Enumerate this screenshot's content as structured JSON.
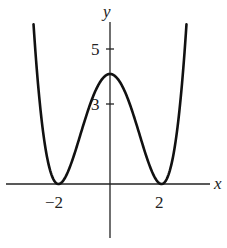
{
  "chart_data": {
    "type": "line",
    "title": "",
    "xlabel": "x",
    "ylabel": "y",
    "function_description": "quartic with double roots at x=-2 and x=2, local maximum at (0,4)",
    "x_ticks": [
      {
        "value": -2,
        "label": "−2"
      },
      {
        "value": 2,
        "label": "2"
      }
    ],
    "y_ticks": [
      {
        "value": 3,
        "label": "3"
      },
      {
        "value": 5,
        "label": "5"
      }
    ],
    "xlim": [
      -4.25,
      4.25
    ],
    "ylim": [
      -2,
      6.3
    ],
    "grid": false,
    "legend": null,
    "series": [
      {
        "name": "f(x)",
        "x": [
          -2.97,
          -2.5,
          -2.0,
          -1.5,
          -1.0,
          -0.5,
          0.0,
          0.5,
          1.0,
          1.5,
          2.0,
          2.5,
          2.97
        ],
        "y": [
          5.85,
          1.27,
          0.0,
          0.77,
          2.25,
          3.52,
          4.0,
          3.52,
          2.25,
          0.77,
          0.0,
          1.27,
          5.85
        ]
      }
    ],
    "key_points": [
      {
        "x": -2,
        "y": 0,
        "kind": "minimum"
      },
      {
        "x": 0,
        "y": 4,
        "kind": "local maximum"
      },
      {
        "x": 2,
        "y": 0,
        "kind": "minimum"
      }
    ]
  },
  "labels": {
    "x_axis": "x",
    "y_axis": "y",
    "tick_neg2": "−2",
    "tick_2": "2",
    "tick_3": "3",
    "tick_5": "5"
  }
}
